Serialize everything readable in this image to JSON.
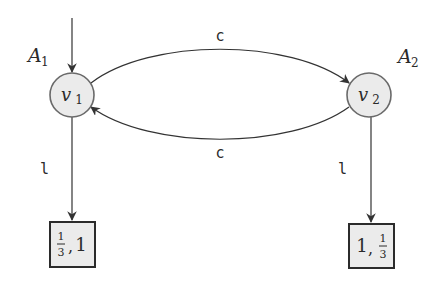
{
  "diagram": {
    "type": "game-graph",
    "nodes": [
      {
        "id": "v1",
        "label": "v",
        "subscript": "1",
        "owner": "A",
        "owner_sub": "1",
        "has_initial_arrow": true
      },
      {
        "id": "v2",
        "label": "v",
        "subscript": "2",
        "owner": "A",
        "owner_sub": "2",
        "has_initial_arrow": false
      }
    ],
    "leaves": [
      {
        "id": "leaf1",
        "parent": "v1",
        "payoff_text": "1/3, 1",
        "first": "1",
        "first_den": "3",
        "second": "1"
      },
      {
        "id": "leaf2",
        "parent": "v2",
        "payoff_text": "1, 1/3",
        "first": "1",
        "second": "1",
        "second_den": "3"
      }
    ],
    "edges": [
      {
        "from": "v1",
        "to": "v2",
        "label": "c"
      },
      {
        "from": "v2",
        "to": "v1",
        "label": "c"
      },
      {
        "from": "v1",
        "to": "leaf1",
        "label": "l"
      },
      {
        "from": "v2",
        "to": "leaf2",
        "label": "l"
      }
    ],
    "colors": {
      "node_fill": "#ebebeb",
      "node_stroke": "#6a6a6a",
      "edge": "#333333",
      "text": "#2a2a2a"
    }
  }
}
